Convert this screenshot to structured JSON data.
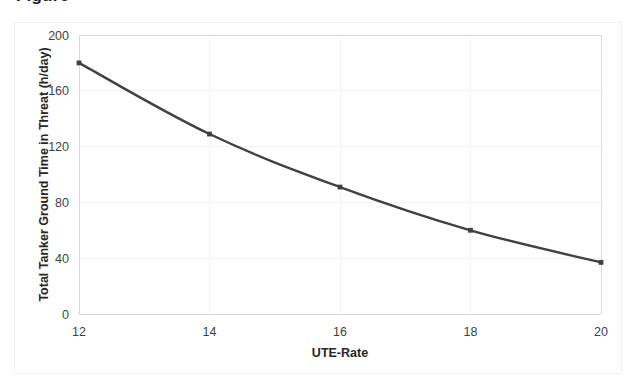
{
  "figure": {
    "background": "#ffffff",
    "border_color": "#f0f0f0",
    "cropped_title_fragment": "Figure"
  },
  "chart_data": {
    "type": "line",
    "title": "",
    "xlabel": "UTE-Rate",
    "ylabel": "Total Tanker Ground Time in Threat (h/day)",
    "x": [
      12,
      14,
      16,
      18,
      20
    ],
    "values": [
      180,
      129,
      91,
      60,
      37
    ],
    "series": [
      {
        "name": "Total Tanker Ground Time in Threat",
        "values": [
          180,
          129,
          91,
          60,
          37
        ],
        "color": "#404040"
      }
    ],
    "xlim": [
      12,
      20
    ],
    "ylim": [
      0,
      200
    ],
    "xticks": [
      12,
      14,
      16,
      18,
      20
    ],
    "yticks": [
      0,
      40,
      80,
      120,
      160,
      200
    ],
    "xtick_labels": [
      "12",
      "14",
      "16",
      "18",
      "20"
    ],
    "ytick_labels": [
      "0",
      "40",
      "80",
      "120",
      "160",
      "200"
    ],
    "grid": "horizontal-and-vertical",
    "legend": "none",
    "marker": "small-square",
    "line_color": "#404040",
    "grid_color": "#f2f2f2",
    "axis_color": "#d9d9d9"
  }
}
